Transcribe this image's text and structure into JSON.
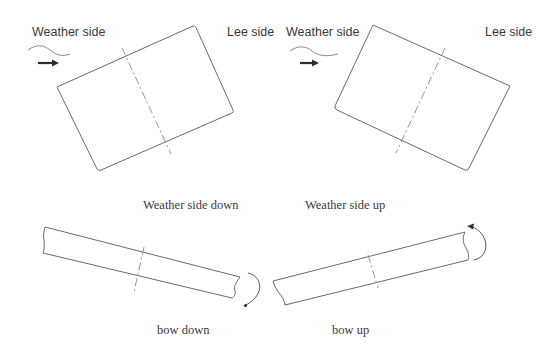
{
  "panels": {
    "weather_side_down": {
      "weather_label": "Weather side",
      "lee_label": "Lee side",
      "caption": "Weather side down",
      "icons": [
        "wave-icon",
        "wind-arrow-icon"
      ]
    },
    "weather_side_up": {
      "weather_label": "Weather side",
      "lee_label": "Lee side",
      "caption": "Weather side up",
      "icons": [
        "wave-icon",
        "wind-arrow-icon"
      ]
    },
    "bow_down": {
      "caption": "bow down",
      "icons": [
        "rotation-arrow-icon"
      ]
    },
    "bow_up": {
      "caption": "bow up",
      "icons": [
        "rotation-arrow-icon"
      ]
    }
  },
  "colors": {
    "outline": "#6a6a6a",
    "text": "#3a3a3a",
    "arrow": "#2e2e2e",
    "background": "#ffffff"
  }
}
